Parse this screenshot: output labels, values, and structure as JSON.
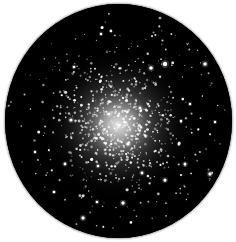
{
  "image": {
    "subject": "globular star cluster in telescope eyepiece view",
    "background_color": "#ffffff",
    "field_color": "#000000",
    "ring_color": "#bdbdbd"
  },
  "field": {
    "cx": 113.5,
    "cy": 117,
    "rx": 113.5,
    "ry": 117
  },
  "core": {
    "cx": 113,
    "cy": 121,
    "inner_color": "#f4f4f4",
    "mid_color": "#8c8c8c",
    "outer_color": "#2a2a2a",
    "radius": 78
  },
  "stars": {
    "seed": 7,
    "core_count": 520,
    "halo_count": 260,
    "bright_count": 34,
    "core_sigma": 26,
    "color": "#ffffff"
  },
  "bright_stars": [
    [
      160,
      60,
      2.2
    ],
    [
      146,
      64,
      1.8
    ],
    [
      200,
      60,
      1.8
    ],
    [
      66,
      116,
      1.6
    ],
    [
      30,
      148,
      1.2
    ],
    [
      78,
      214,
      1.7
    ],
    [
      118,
      199,
      1.7
    ],
    [
      205,
      170,
      1.7
    ],
    [
      160,
      176,
      1.6
    ],
    [
      180,
      160,
      1.5
    ],
    [
      137,
      169,
      1.4
    ],
    [
      92,
      198,
      1.3
    ],
    [
      69,
      63,
      1.3
    ],
    [
      96,
      30,
      1.2
    ],
    [
      155,
      14,
      1.1
    ],
    [
      210,
      118,
      1.2
    ],
    [
      49,
      188,
      1.3
    ],
    [
      60,
      160,
      1.4
    ],
    [
      176,
      117,
      1.2
    ],
    [
      93,
      162,
      1.3
    ],
    [
      185,
      100,
      1.2
    ],
    [
      135,
      104,
      1.5
    ],
    [
      104,
      110,
      1.6
    ],
    [
      123,
      140,
      1.6
    ]
  ]
}
